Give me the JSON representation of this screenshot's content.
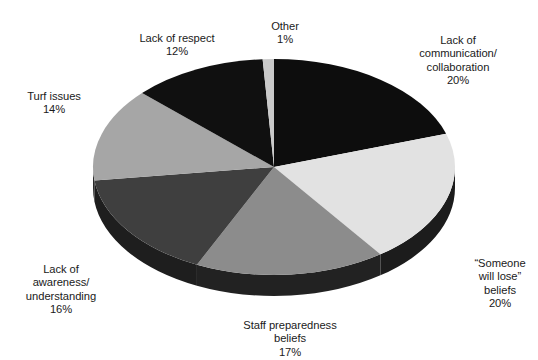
{
  "chart_data": {
    "type": "pie",
    "title": "",
    "subtitle": "",
    "xlabel": "",
    "ylabel": "",
    "legend_position": "none",
    "grid": false,
    "three_d": true,
    "start_angle_deg": 0,
    "direction": "clockwise",
    "unit": "%",
    "categories": [
      "Lack of communication/ collaboration",
      "“Someone will lose” beliefs",
      "Staff preparedness beliefs",
      "Lack of awareness/ understanding",
      "Turf issues",
      "Lack of respect",
      "Other"
    ],
    "values": [
      20,
      20,
      17,
      16,
      14,
      12,
      1
    ],
    "total": 100,
    "slices": [
      {
        "key": "communication",
        "label": "Lack of\ncommunication/\ncollaboration",
        "percent_text": "20%",
        "value": 20,
        "color": "#0d0d0d",
        "side_color": "#050505"
      },
      {
        "key": "someone-will-lose",
        "label": "“Someone\nwill lose”\nbeliefs",
        "percent_text": "20%",
        "value": 20,
        "color": "#e2e2e2",
        "side_color": "#1c1c1c"
      },
      {
        "key": "staff-preparedness",
        "label": "Staff preparedness\nbeliefs",
        "percent_text": "17%",
        "value": 17,
        "color": "#8c8c8c",
        "side_color": "#222222"
      },
      {
        "key": "awareness-understanding",
        "label": "Lack of\nawareness/\nunderstanding",
        "percent_text": "16%",
        "value": 16,
        "color": "#3f3f3f",
        "side_color": "#1e1e1e"
      },
      {
        "key": "turf-issues",
        "label": "Turf issues",
        "percent_text": "14%",
        "value": 14,
        "color": "#a6a6a6",
        "side_color": "#2a2a2a"
      },
      {
        "key": "lack-of-respect",
        "label": "Lack of respect",
        "percent_text": "12%",
        "value": 12,
        "color": "#101010",
        "side_color": "#060606"
      },
      {
        "key": "other",
        "label": "Other",
        "percent_text": "1%",
        "value": 1,
        "color": "#c9c9c9",
        "side_color": "#2a2a2a"
      }
    ],
    "geometry": {
      "center_x": 274,
      "center_y": 167,
      "radius_x": 181,
      "radius_y": 108,
      "depth": 21
    },
    "background_color": "#ffffff",
    "text_color": "#1a1a1a"
  }
}
